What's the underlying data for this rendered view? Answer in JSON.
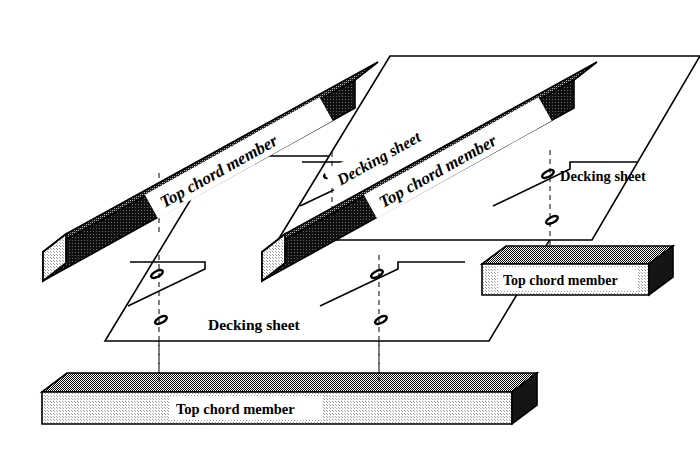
{
  "figure": {
    "kind": "isometric-exploded-assembly-diagram",
    "background_color": "#ffffff",
    "ink_color": "#000000",
    "width": 700,
    "height": 451
  },
  "labels": {
    "top_chord_member": "Top chord member",
    "decking_sheet": "Decking sheet"
  },
  "parts": [
    {
      "id": "beam-upper-left",
      "name": "Top chord member",
      "label": "Top chord member",
      "orientation": "diagonal",
      "label_rotation_deg": -30,
      "faces": {
        "end": "#e8e8e8",
        "top": "#7a7a7a",
        "front": "#141414"
      }
    },
    {
      "id": "beam-upper-right",
      "name": "Top chord member",
      "label": "Top chord member",
      "orientation": "diagonal",
      "label_rotation_deg": -30,
      "faces": {
        "end": "#e8e8e8",
        "top": "#7a7a7a",
        "front": "#141414"
      }
    },
    {
      "id": "beam-mid-right",
      "name": "Top chord member",
      "label": "Top chord member",
      "orientation": "horizontal",
      "label_rotation_deg": 0,
      "faces": {
        "end": "#1a1a1a",
        "top": "#6e6e6e",
        "front": "#d8d8d8"
      }
    },
    {
      "id": "beam-bottom",
      "name": "Top chord member",
      "label": "Top chord member",
      "orientation": "horizontal",
      "label_rotation_deg": 0,
      "faces": {
        "end": "#1a1a1a",
        "top": "#6e6e6e",
        "front": "#dcdcdc"
      }
    },
    {
      "id": "sheet-upper",
      "name": "Decking sheet",
      "label": "Decking sheet",
      "orientation": "diagonal",
      "label_rotation_deg": -30,
      "slot_count": 4
    },
    {
      "id": "sheet-upper-right",
      "name": "Decking sheet",
      "label": "Decking sheet",
      "orientation": "horizontal",
      "label_rotation_deg": 0,
      "slot_count": 4
    },
    {
      "id": "sheet-lower",
      "name": "Decking sheet",
      "label": "Decking sheet",
      "orientation": "horizontal",
      "label_rotation_deg": 0,
      "slot_count": 4
    }
  ],
  "annotations": {
    "alignment_lines": "dashed vertical center lines connecting slot holes to chord members",
    "slot_shape": "rotated elongated oval (bolt slot)"
  }
}
